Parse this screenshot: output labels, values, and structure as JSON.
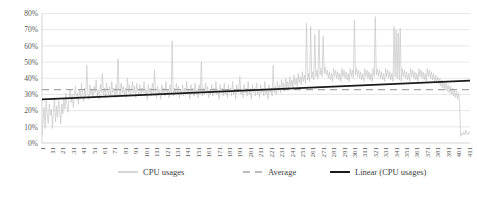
{
  "chart_data": {
    "type": "line",
    "title": "",
    "xlabel": "",
    "ylabel": "",
    "ylim": [
      0,
      0.8
    ],
    "y_tick_labels": [
      "0%",
      "10%",
      "20%",
      "30%",
      "40%",
      "50%",
      "60%",
      "70%",
      "80%"
    ],
    "y_tick_values": [
      0,
      10,
      20,
      30,
      40,
      50,
      60,
      70,
      80
    ],
    "grid": true,
    "legend_position": "bottom",
    "x_tick_labels": [
      "1",
      "11",
      "21",
      "31",
      "41",
      "51",
      "61",
      "71",
      "81",
      "91",
      "101",
      "111",
      "121",
      "131",
      "141",
      "151",
      "161",
      "171",
      "181",
      "191",
      "201",
      "211",
      "221",
      "231",
      "241",
      "251",
      "261",
      "271",
      "281",
      "291",
      "301",
      "311",
      "321",
      "331",
      "341",
      "351",
      "361",
      "371",
      "381",
      "391",
      "401",
      "411"
    ],
    "x_range": [
      1,
      416
    ],
    "series": [
      {
        "name": "CPU usages",
        "kind": "line",
        "color": "#c9c9c9",
        "values": [
          5,
          14,
          22,
          9,
          26,
          18,
          12,
          24,
          17,
          21,
          9,
          19,
          28,
          13,
          23,
          16,
          26,
          20,
          12,
          24,
          18,
          27,
          21,
          31,
          23,
          19,
          28,
          33,
          25,
          30,
          22,
          29,
          35,
          27,
          31,
          24,
          33,
          28,
          37,
          30,
          26,
          34,
          29,
          48,
          31,
          27,
          36,
          30,
          33,
          28,
          35,
          31,
          39,
          29,
          33,
          27,
          36,
          31,
          43,
          30,
          34,
          28,
          37,
          32,
          30,
          35,
          29,
          38,
          31,
          34,
          28,
          36,
          30,
          52,
          33,
          29,
          37,
          31,
          35,
          30,
          34,
          28,
          40,
          31,
          36,
          29,
          33,
          38,
          31,
          35,
          28,
          37,
          32,
          30,
          36,
          29,
          34,
          31,
          38,
          30,
          33,
          27,
          36,
          31,
          34,
          29,
          37,
          30,
          45,
          32,
          28,
          35,
          30,
          33,
          27,
          36,
          31,
          34,
          29,
          38,
          30,
          33,
          28,
          36,
          31,
          63,
          29,
          34,
          30,
          37,
          31,
          35,
          28,
          33,
          30,
          36,
          29,
          34,
          31,
          38,
          30,
          33,
          27,
          36,
          31,
          34,
          29,
          37,
          30,
          33,
          28,
          36,
          31,
          50,
          29,
          34,
          30,
          37,
          31,
          35,
          28,
          33,
          30,
          36,
          29,
          34,
          31,
          38,
          30,
          33,
          27,
          36,
          31,
          34,
          29,
          37,
          30,
          33,
          28,
          36,
          31,
          34,
          29,
          38,
          30,
          33,
          27,
          36,
          31,
          34,
          41,
          30,
          33,
          28,
          36,
          31,
          34,
          29,
          38,
          30,
          33,
          27,
          36,
          31,
          34,
          29,
          37,
          30,
          33,
          28,
          36,
          31,
          34,
          29,
          38,
          30,
          33,
          27,
          36,
          31,
          34,
          29,
          48,
          31,
          35,
          30,
          38,
          32,
          36,
          31,
          39,
          33,
          37,
          32,
          40,
          34,
          38,
          33,
          41,
          35,
          39,
          34,
          42,
          36,
          40,
          35,
          43,
          37,
          41,
          36,
          44,
          38,
          42,
          37,
          74,
          39,
          43,
          38,
          72,
          40,
          44,
          39,
          67,
          41,
          45,
          40,
          70,
          42,
          46,
          41,
          66,
          43,
          47,
          42,
          45,
          40,
          44,
          39,
          43,
          38,
          46,
          41,
          45,
          40,
          44,
          39,
          43,
          38,
          46,
          41,
          45,
          40,
          44,
          39,
          43,
          38,
          46,
          41,
          45,
          40,
          76,
          42,
          46,
          41,
          45,
          40,
          44,
          39,
          43,
          38,
          46,
          41,
          45,
          40,
          44,
          39,
          43,
          38,
          46,
          41,
          78,
          42,
          46,
          41,
          45,
          40,
          44,
          39,
          43,
          38,
          46,
          41,
          45,
          40,
          44,
          39,
          43,
          38,
          72,
          41,
          70,
          40,
          68,
          39,
          71,
          38,
          46,
          41,
          45,
          40,
          44,
          39,
          43,
          38,
          46,
          41,
          45,
          40,
          44,
          39,
          43,
          38,
          46,
          41,
          45,
          40,
          44,
          39,
          43,
          38,
          46,
          41,
          45,
          40,
          44,
          39,
          43,
          38,
          42,
          37,
          41,
          36,
          40,
          35,
          39,
          34,
          38,
          33,
          37,
          32,
          36,
          31,
          35,
          30,
          34,
          29,
          33,
          28,
          32,
          27,
          31,
          26,
          4,
          6,
          5,
          7,
          5,
          8,
          6,
          5,
          7,
          6
        ]
      },
      {
        "name": "Average",
        "kind": "dashed",
        "color": "#a6a6a6",
        "constant_value": 33
      },
      {
        "name": "Linear (CPU usages)",
        "kind": "trendline",
        "color": "#1a1a1a",
        "start_value": 27,
        "end_value": 38.5
      }
    ]
  },
  "legend": {
    "items": [
      {
        "label": "CPU usages",
        "style": "solid",
        "color": "#c9c9c9"
      },
      {
        "label": "Average",
        "style": "dashed",
        "color": "#a6a6a6"
      },
      {
        "label": "Linear (CPU usages)",
        "style": "solid",
        "color": "#1a1a1a"
      }
    ]
  }
}
